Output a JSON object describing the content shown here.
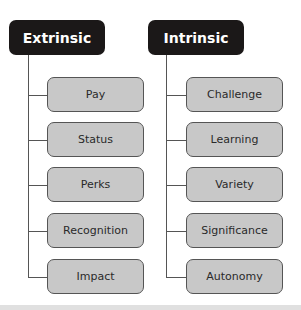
{
  "columns": [
    {
      "title": "Extrinsic",
      "items": [
        "Pay",
        "Status",
        "Perks",
        "Recognition",
        "Impact"
      ]
    },
    {
      "title": "Intrinsic",
      "items": [
        "Challenge",
        "Learning",
        "Variety",
        "Significance",
        "Autonomy"
      ]
    }
  ],
  "colors": {
    "header_bg": "#1b1818",
    "header_text": "#ffffff",
    "box_bg": "#c8c8c8",
    "line": "#555555"
  }
}
